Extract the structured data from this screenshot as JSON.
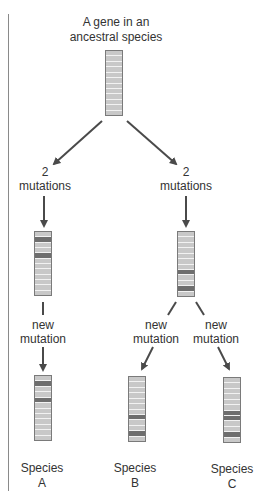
{
  "title": {
    "line1": "A gene in an",
    "line2": "ancestral species"
  },
  "branches": {
    "left_mutations": {
      "count": "2",
      "text": "mutations"
    },
    "right_mutations": {
      "count": "2",
      "text": "mutations"
    },
    "new_mutation_a": {
      "line1": "new",
      "line2": "mutation"
    },
    "new_mutation_b": {
      "line1": "new",
      "line2": "mutation"
    },
    "new_mutation_c": {
      "line1": "new",
      "line2": "mutation"
    }
  },
  "species": [
    {
      "line1": "Species",
      "line2": "A"
    },
    {
      "line1": "Species",
      "line2": "B"
    },
    {
      "line1": "Species",
      "line2": "C"
    }
  ],
  "genes": {
    "band_count": 12,
    "ancestral_mutated_bands": [],
    "intermediate_left_mutated_bands": [
      1,
      4
    ],
    "intermediate_right_mutated_bands": [
      7,
      10
    ],
    "species_a_mutated_bands": [
      1,
      4
    ],
    "species_b_mutated_bands": [
      7,
      10
    ],
    "species_c_mutated_bands": [
      6,
      7,
      10
    ]
  },
  "colors": {
    "band_normal": "#c8c8c8",
    "band_mutated": "#6e6e6e",
    "band_separator": "#f2f2f2",
    "arrow": "#4a4a4a"
  }
}
